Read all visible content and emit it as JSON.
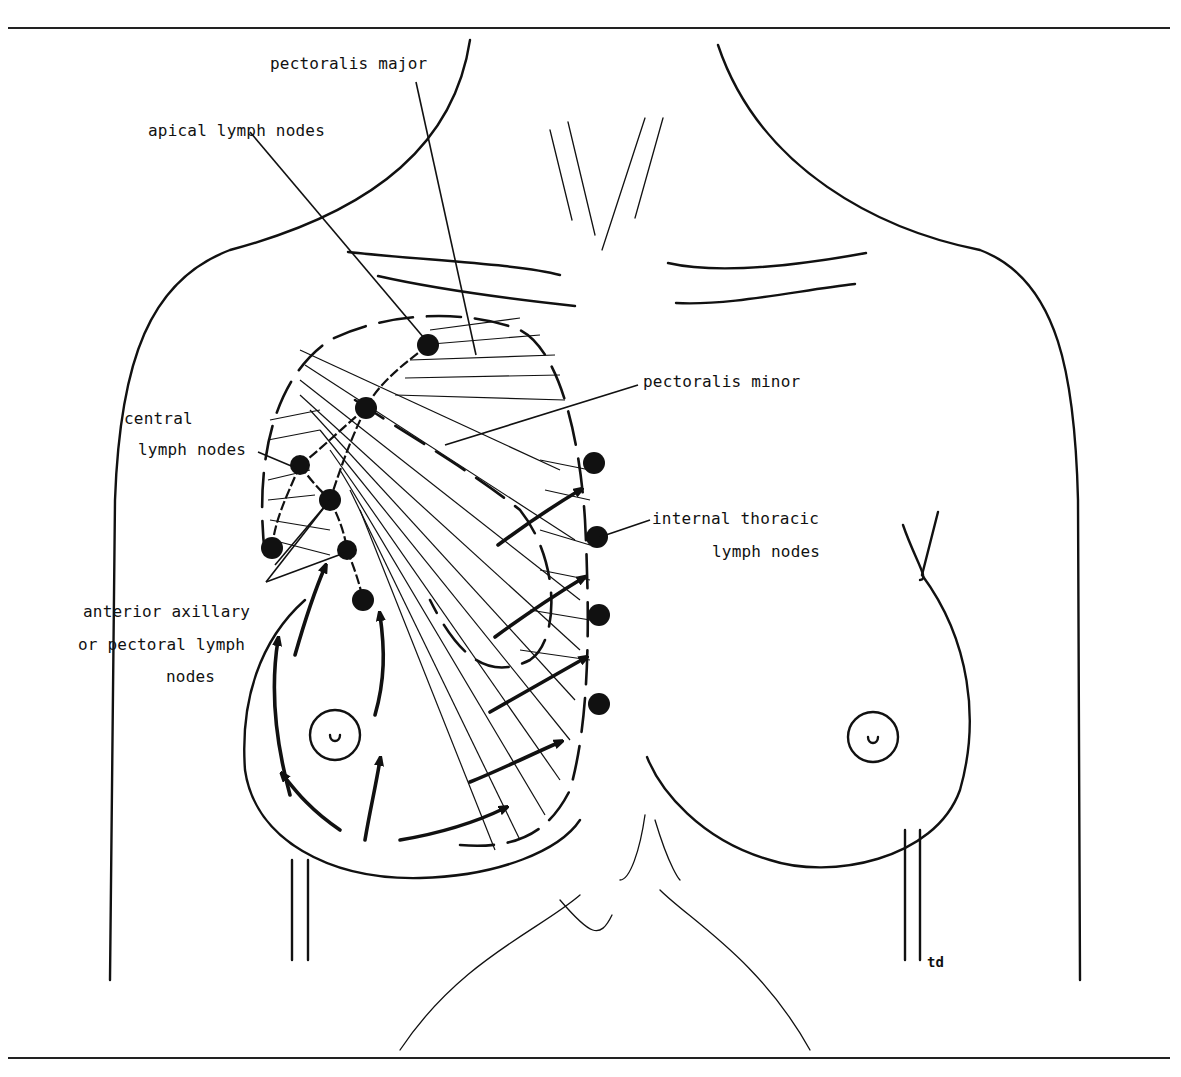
{
  "figure": {
    "labels": {
      "pectoralis_major": "pectoralis major",
      "apical_lymph_nodes": "apical lymph nodes",
      "pectoralis_minor": "pectoralis minor",
      "central_line1": "central",
      "central_line2": "lymph nodes",
      "internal_thoracic_line1": "internal thoracic",
      "internal_thoracic_line2": "lymph nodes",
      "anterior_line1": "anterior axillary",
      "anterior_line2": "or pectoral lymph",
      "anterior_line3": "nodes"
    },
    "artist_mark": "td",
    "colors": {
      "ink": "#111111",
      "background": "#ffffff"
    },
    "node_counts": {
      "axillary_nodes": 7,
      "internal_thoracic_nodes": 4
    }
  }
}
